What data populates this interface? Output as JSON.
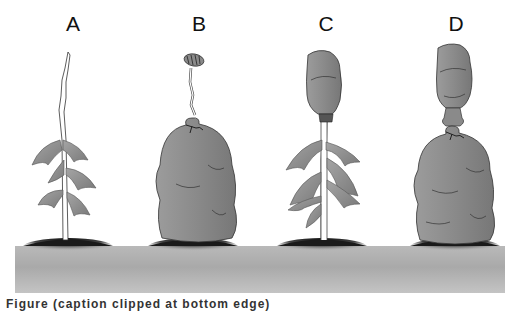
{
  "figure": {
    "panels": [
      {
        "label": "A",
        "description": "plant with apical bud, no bags"
      },
      {
        "label": "B",
        "description": "apical bud held above a bag enclosing leaves"
      },
      {
        "label": "C",
        "description": "apical bud enclosed in bag, leaves exposed"
      },
      {
        "label": "D",
        "description": "both apical bud and leaves enclosed in bags"
      }
    ],
    "caption": "Figure (caption clipped at bottom edge)"
  },
  "colors": {
    "leaf": "#8f8f8f",
    "bag": "#8a8a8a",
    "ground": "#b0b0b0",
    "mound": "#1e1e1e"
  }
}
